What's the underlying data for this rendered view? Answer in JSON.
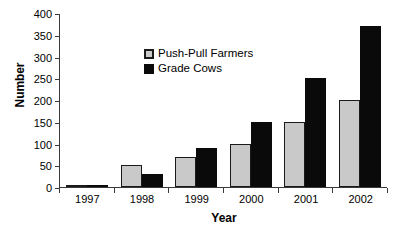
{
  "chart_data": {
    "type": "bar",
    "title": "",
    "xlabel": "Year",
    "ylabel": "Number",
    "categories": [
      "1997",
      "1998",
      "1999",
      "2000",
      "2001",
      "2002"
    ],
    "series": [
      {
        "name": "Push-Pull Farmers",
        "color": "#c9c9c9",
        "values": [
          5,
          50,
          70,
          100,
          150,
          200
        ]
      },
      {
        "name": "Grade Cows",
        "color": "#0a0a0a",
        "values": [
          3,
          30,
          90,
          150,
          250,
          370
        ]
      }
    ],
    "ylim": [
      0,
      400
    ],
    "yticks": [
      0,
      50,
      100,
      150,
      200,
      250,
      300,
      350,
      400
    ],
    "grid": false,
    "legend_position": "upper-left-inside"
  },
  "legend": {
    "items": [
      {
        "label": "Push-Pull Farmers",
        "swatch": "gray-square-swatch"
      },
      {
        "label": "Grade Cows",
        "swatch": "black-square-swatch"
      }
    ]
  }
}
